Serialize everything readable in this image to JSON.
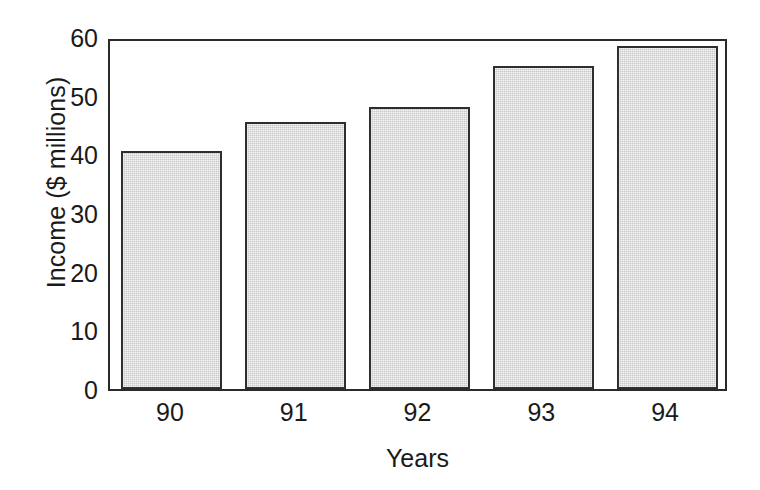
{
  "chart_data": {
    "type": "bar",
    "title": "",
    "subtitle": "",
    "xlabel": "Years",
    "ylabel": "Income ($ millions)",
    "categories": [
      "90",
      "91",
      "92",
      "93",
      "94"
    ],
    "values": [
      40.5,
      45.5,
      48,
      55,
      58.5
    ],
    "series": [
      {
        "name": "Income",
        "values": [
          40.5,
          45.5,
          48,
          55,
          58.5
        ]
      }
    ],
    "ylim": [
      0,
      60
    ],
    "yticks": [
      0,
      10,
      20,
      30,
      40,
      50,
      60
    ],
    "ytick_labels": [
      "0",
      "10",
      "20",
      "30",
      "40",
      "50",
      "60"
    ],
    "gridlines": {
      "horizontal": [
        10,
        20,
        30,
        40,
        50
      ],
      "style": "dotted",
      "vertical": false
    },
    "legend": {
      "visible": false,
      "position": "none",
      "entries": []
    },
    "annotations": [],
    "colors": {
      "bar_fill": "#c9c9c9",
      "bar_border": "#2e2e2e",
      "axis": "#2a2a2a",
      "grid": "#8c8c8c",
      "text": "#1a1a1a",
      "background": "#ffffff"
    }
  }
}
